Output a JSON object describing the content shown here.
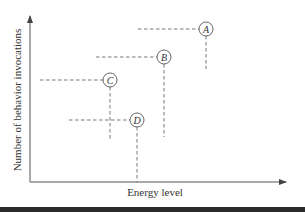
{
  "diagram": {
    "axes": {
      "x_label": "Energy level",
      "y_label": "Number of behavior invocations",
      "origin": [
        30,
        182
      ],
      "x_end": 286,
      "y_end": 16
    },
    "points": [
      {
        "id": "A",
        "label": "A",
        "cx": 206,
        "cy": 29,
        "h_start": 138,
        "v_end": 69
      },
      {
        "id": "B",
        "label": "B",
        "cx": 164,
        "cy": 57,
        "h_start": 96,
        "v_end": 137
      },
      {
        "id": "C",
        "label": "C",
        "cx": 110,
        "cy": 80,
        "h_start": 40,
        "v_end": 140
      },
      {
        "id": "D",
        "label": "D",
        "cx": 137,
        "cy": 120,
        "h_start": 69,
        "v_end": 182
      }
    ],
    "circle_radius": 7,
    "colors": {
      "line": "#555555",
      "dash": "#666666",
      "text": "#333333",
      "bottom_bar": "#2a2a2a"
    }
  }
}
